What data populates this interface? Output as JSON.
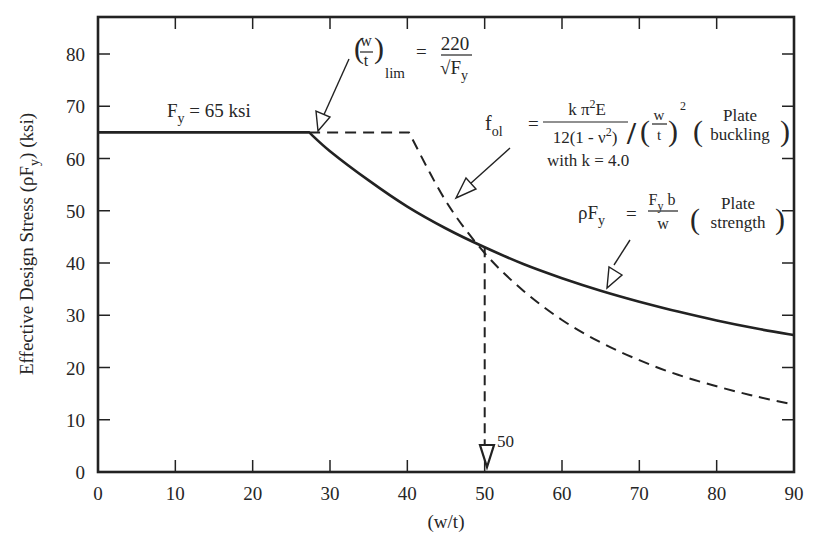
{
  "chart_data": {
    "type": "line",
    "title": "",
    "xlabel": "(w/t)",
    "ylabel": "Effective Design Stress (ρFᵧ) (ksi)",
    "ylabel_parts": {
      "main": "Effective Design Stress (ρF",
      "sub": "y",
      "tail": ") (ksi)"
    },
    "xlim": [
      0,
      90
    ],
    "ylim": [
      0,
      85
    ],
    "x_ticks": [
      0,
      10,
      20,
      30,
      40,
      50,
      60,
      70,
      80,
      90
    ],
    "y_ticks": [
      0,
      10,
      20,
      30,
      40,
      50,
      60,
      70,
      80
    ],
    "grid": false,
    "legend": "none",
    "series": [
      {
        "name": "Plate strength ρFᵧ = Fᵧ b / w",
        "style": "solid",
        "x": [
          0,
          27.3,
          30,
          35,
          40,
          45,
          50,
          55,
          60,
          65,
          70,
          75,
          80,
          85,
          90
        ],
        "values": [
          65,
          65,
          61.4,
          55.8,
          50.8,
          46.6,
          43.0,
          39.8,
          37.1,
          34.7,
          32.6,
          30.7,
          29.0,
          27.5,
          26.2
        ]
      },
      {
        "name": "Plate buckling f_ol (k = 4.0)",
        "style": "dashed",
        "x": [
          27.3,
          40.2,
          45,
          50,
          55,
          60,
          65,
          70,
          75,
          80,
          85,
          90
        ],
        "values": [
          65,
          65,
          51.8,
          41.9,
          34.7,
          29.1,
          24.8,
          21.4,
          18.6,
          16.4,
          14.5,
          12.9
        ]
      },
      {
        "name": "w/t = 50 drop line",
        "style": "dashed",
        "x": [
          50,
          50
        ],
        "values": [
          43.0,
          0
        ]
      }
    ],
    "annotations": [
      {
        "id": "fy",
        "text": "Fᵧ = 65 ksi",
        "main": "F",
        "sub": "y",
        "tail": " = 65 ksi",
        "x": 13,
        "y": 69
      },
      {
        "id": "wt_lim",
        "lhs_num": "w",
        "lhs_den": "t",
        "lhs_sub": "lim",
        "eq": "=",
        "rhs_num": "220",
        "rhs_den_main": "√F",
        "rhs_den_sub": "y",
        "points_to": [
          27.3,
          65
        ]
      },
      {
        "id": "fol",
        "lhs": "f",
        "lhs_sub": "ol",
        "eq": "=",
        "num": "k π²E",
        "num_main": "k π",
        "num_sup": "2",
        "num_tail": "E",
        "den_main": "12(1 - ν",
        "den_sup": "2",
        "den_tail": ")",
        "slash": "/",
        "wt_num": "w",
        "wt_den": "t",
        "wt_sup": "2",
        "paren_top": "Plate",
        "paren_bottom": "buckling",
        "note": "with k = 4.0",
        "points_to": [
          46,
          52
        ]
      },
      {
        "id": "rho",
        "lhs_main": "ρF",
        "lhs_sub": "y",
        "eq": "=",
        "num_main": "F",
        "num_sub": "y",
        "num_tail": " b",
        "den": "w",
        "paren_top": "Plate",
        "paren_bottom": "strength",
        "points_to": [
          65,
          34.7
        ]
      },
      {
        "id": "marker50",
        "text": "50",
        "x": 50,
        "y": 0
      }
    ]
  }
}
